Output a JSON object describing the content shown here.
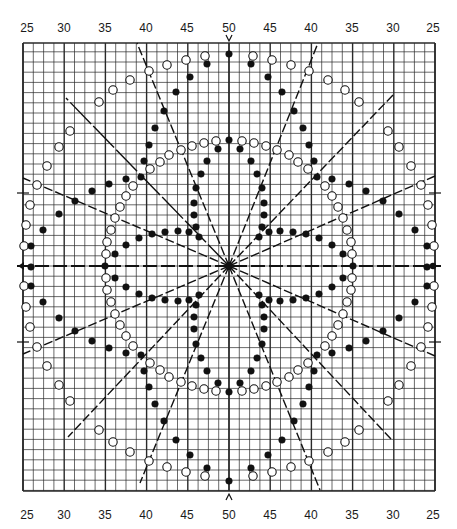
{
  "chart_data": {
    "type": "scatter",
    "title": "",
    "top_tick_labels": [
      "25",
      "30",
      "35",
      "40",
      "45",
      "50",
      "45",
      "40",
      "35",
      "30",
      "25"
    ],
    "bottom_tick_labels": [
      "25",
      "30",
      "35",
      "40",
      "45",
      "50",
      "45",
      "40",
      "35",
      "30",
      "25"
    ],
    "tick_label_x_px": [
      27,
      64,
      105,
      146,
      187,
      229,
      270,
      311,
      352,
      393,
      433
    ],
    "grid": {
      "on": true,
      "left": 23,
      "top": 43,
      "right": 435,
      "bottom": 491,
      "center_x": 229,
      "center_y": 266,
      "cell_w": 10.3,
      "cell_h": 10.2,
      "heavy_every": 4,
      "line_color": "#2a2a2a"
    },
    "center_markers": {
      "top": "v",
      "bottom": "^",
      "left": "arrow",
      "right": "dot"
    },
    "side_ticks_y": [
      193,
      342
    ],
    "radial_lines": [
      {
        "x": 137,
        "y": 43,
        "style": "dashed"
      },
      {
        "x": 318,
        "y": 43,
        "style": "dashed"
      },
      {
        "x": 66,
        "y": 98,
        "style": "longdash"
      },
      {
        "x": 393,
        "y": 95,
        "style": "dashed"
      },
      {
        "x": 23,
        "y": 178,
        "style": "dashed"
      },
      {
        "x": 435,
        "y": 176,
        "style": "dashed"
      },
      {
        "x": 23,
        "y": 354,
        "style": "dashed"
      },
      {
        "x": 435,
        "y": 356,
        "style": "dashed"
      },
      {
        "x": 68,
        "y": 437,
        "style": "dashed"
      },
      {
        "x": 391,
        "y": 439,
        "style": "dashed"
      },
      {
        "x": 140,
        "y": 483,
        "style": "dashed"
      },
      {
        "x": 320,
        "y": 490,
        "style": "dashed"
      }
    ],
    "series": [
      {
        "name": "outer-open",
        "marker": "open-circle",
        "upper_left_quadrant_px": [
          [
            205,
            56
          ],
          [
            186,
            60
          ],
          [
            167,
            65
          ],
          [
            149,
            71
          ],
          [
            130,
            80
          ],
          [
            113,
            90
          ],
          [
            99,
            102
          ],
          [
            70,
            131
          ],
          [
            59,
            147
          ],
          [
            47,
            166
          ],
          [
            37,
            185
          ],
          [
            30,
            205
          ],
          [
            26,
            225
          ],
          [
            24,
            246
          ]
        ]
      },
      {
        "name": "outer-filled",
        "marker": "filled-circle",
        "upper_left_quadrant_px": [
          [
            207,
            64
          ],
          [
            190,
            77
          ],
          [
            176,
            92
          ],
          [
            164,
            111
          ],
          [
            155,
            128
          ],
          [
            149,
            145
          ],
          [
            144,
            161
          ],
          [
            141,
            177
          ],
          [
            126,
            179
          ],
          [
            109,
            184
          ],
          [
            92,
            191
          ],
          [
            75,
            201
          ],
          [
            59,
            214
          ],
          [
            43,
            230
          ],
          [
            31,
            246
          ]
        ]
      },
      {
        "name": "inner-open",
        "marker": "open-circle",
        "upper_left_quadrant_px": [
          [
            216,
            141
          ],
          [
            204,
            143
          ],
          [
            192,
            146
          ],
          [
            181,
            150
          ],
          [
            169,
            155
          ],
          [
            160,
            162
          ],
          [
            150,
            169
          ],
          [
            133,
            186
          ],
          [
            126,
            196
          ],
          [
            120,
            207
          ],
          [
            115,
            218
          ],
          [
            111,
            230
          ],
          [
            107,
            242
          ],
          [
            106,
            254
          ]
        ]
      },
      {
        "name": "inner-filled",
        "marker": "filled-circle",
        "upper_left_quadrant_px": [
          [
            218,
            149
          ],
          [
            207,
            161
          ],
          [
            201,
            174
          ],
          [
            196,
            188
          ],
          [
            194,
            203
          ],
          [
            194,
            215
          ],
          [
            196,
            227
          ],
          [
            199,
            237
          ],
          [
            189,
            232
          ],
          [
            178,
            231
          ],
          [
            165,
            232
          ],
          [
            152,
            234
          ],
          [
            139,
            238
          ],
          [
            126,
            245
          ],
          [
            115,
            254
          ]
        ]
      }
    ],
    "axis_points_filled": [
      [
        229,
        54
      ],
      [
        229,
        140
      ],
      [
        229,
        481
      ],
      [
        229,
        392
      ],
      [
        31,
        267
      ],
      [
        105,
        266
      ],
      [
        427,
        267
      ],
      [
        353,
        266
      ]
    ],
    "symmetry": "mirror about center (229,266) horizontally and vertically"
  }
}
